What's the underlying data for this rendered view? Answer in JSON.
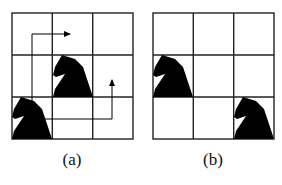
{
  "figure": {
    "panels": [
      {
        "id": "a",
        "label": "(a)",
        "grid": {
          "rows": 3,
          "cols": 3
        },
        "knights": [
          {
            "row": 1,
            "col": 1
          },
          {
            "row": 2,
            "col": 0
          }
        ],
        "arrows": [
          {
            "from": "knight at row 2 col 0",
            "path": "up then right",
            "direction": "right"
          },
          {
            "from": "knight at row 2 col 0",
            "path": "right then up",
            "direction": "up"
          }
        ]
      },
      {
        "id": "b",
        "label": "(b)",
        "grid": {
          "rows": 3,
          "cols": 3
        },
        "knights": [
          {
            "row": 1,
            "col": 0
          },
          {
            "row": 2,
            "col": 2
          }
        ],
        "arrows": []
      }
    ],
    "colors": {
      "line": "#222222",
      "piece": "#000000",
      "background": "#ffffff"
    }
  }
}
